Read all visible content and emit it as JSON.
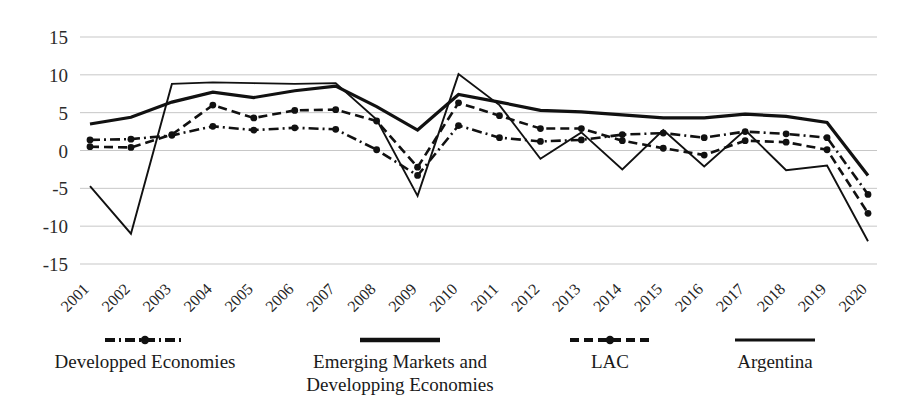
{
  "chart_data": {
    "type": "line",
    "title": "",
    "subtitle": "",
    "xlabel": "",
    "ylabel": "",
    "grid": "horizontal",
    "legend_position": "bottom",
    "ylim": [
      -15,
      15
    ],
    "yticks": [
      "15",
      "10",
      "5",
      "0",
      "-5",
      "-10",
      "-15"
    ],
    "ytick_values": [
      15,
      10,
      5,
      0,
      -5,
      -10,
      -15
    ],
    "categories": [
      "2001",
      "2002",
      "2003",
      "2004",
      "2005",
      "2006",
      "2007",
      "2008",
      "2009",
      "2010",
      "2011",
      "2012",
      "2013",
      "2014",
      "2015",
      "2016",
      "2017",
      "2018",
      "2019",
      "2020"
    ],
    "series": [
      {
        "name": "Developped Economies",
        "style": "dash-dot",
        "marker": "circle",
        "color": "#111111",
        "values": [
          1.4,
          1.5,
          2.0,
          3.2,
          2.7,
          3.0,
          2.8,
          0.1,
          -3.3,
          3.3,
          1.7,
          1.2,
          1.4,
          2.1,
          2.3,
          1.7,
          2.5,
          2.2,
          1.7,
          -5.8
        ]
      },
      {
        "name": "Emerging Markets and Developping Economies",
        "style": "solid-thick",
        "marker": "none",
        "color": "#111111",
        "values": [
          3.5,
          4.4,
          6.4,
          7.7,
          7.0,
          7.9,
          8.5,
          5.8,
          2.7,
          7.4,
          6.4,
          5.3,
          5.1,
          4.7,
          4.3,
          4.3,
          4.8,
          4.5,
          3.7,
          -3.3
        ]
      },
      {
        "name": "LAC",
        "style": "dashed",
        "marker": "circle",
        "color": "#111111",
        "values": [
          0.5,
          0.4,
          2.1,
          6.0,
          4.3,
          5.3,
          5.4,
          3.9,
          -2.2,
          6.3,
          4.6,
          2.9,
          2.9,
          1.3,
          0.3,
          -0.6,
          1.3,
          1.1,
          0.1,
          -8.3
        ]
      },
      {
        "name": "Argentina",
        "style": "solid-thin",
        "marker": "none",
        "color": "#111111",
        "values": [
          -4.7,
          -11.0,
          8.8,
          9.0,
          8.9,
          8.8,
          8.9,
          4.1,
          -6.0,
          10.1,
          6.0,
          -1.1,
          2.4,
          -2.5,
          2.7,
          -2.1,
          2.7,
          -2.6,
          -2.0,
          -12.0
        ]
      }
    ]
  },
  "legend": {
    "items": [
      {
        "label": "Developped Economies",
        "style": "dash-dot",
        "marker": "circle"
      },
      {
        "label": "Emerging Markets and",
        "label2": "Developping Economies",
        "style": "solid-thick",
        "marker": "none"
      },
      {
        "label": "LAC",
        "style": "dashed",
        "marker": "circle"
      },
      {
        "label": "Argentina",
        "style": "solid-thin",
        "marker": "none"
      }
    ]
  }
}
